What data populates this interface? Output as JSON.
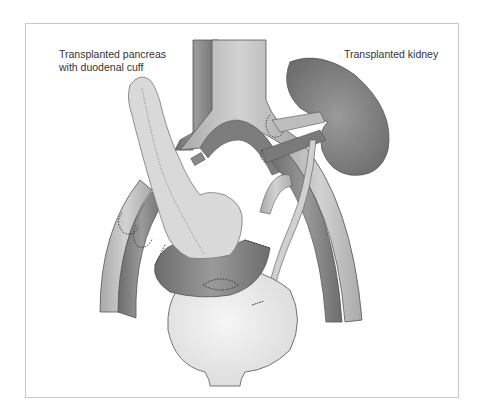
{
  "figure": {
    "labels": {
      "pancreas_line1": "Transplanted pancreas",
      "pancreas_line2": "with duodenal cuff",
      "kidney": "Transplanted kidney"
    },
    "structures": [
      "aorta-vena-cava",
      "iliac-vessels",
      "transplanted-pancreas",
      "duodenal-cuff",
      "transplanted-kidney",
      "ureter",
      "bladder"
    ],
    "colors": {
      "vessel_light": "#b9b9b9",
      "vessel_dark": "#7a7a7a",
      "organ_dark": "#808080",
      "pancreas": "#d8d8d8",
      "bladder": "#ececec",
      "outline": "#555555"
    }
  }
}
